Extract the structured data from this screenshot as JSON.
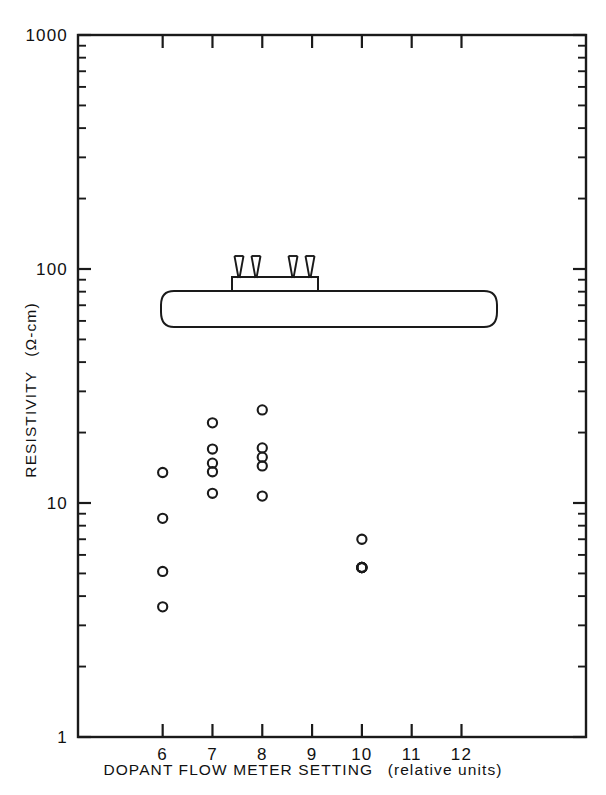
{
  "figure": {
    "background_color": "#ffffff",
    "ink_color": "#1a1a1a"
  },
  "chart_data": {
    "type": "scatter",
    "title": "",
    "xlabel": "DOPANT FLOW METER SETTING (relative units)",
    "xlabel_main": "DOPANT FLOW METER SETTING",
    "xlabel_paren": "(relative units)",
    "ylabel": "RESISTIVITY (Ω-cm)",
    "ylabel_main": "RESISTIVITY",
    "ylabel_paren": "(Ω-cm)",
    "xscale": "linear",
    "yscale": "log",
    "xlim": [
      4.3,
      14.5
    ],
    "ylim": [
      1,
      1000
    ],
    "grid": false,
    "legend": null,
    "x_tick_labels": [
      "6",
      "7",
      "8",
      "9",
      "10",
      "11",
      "12"
    ],
    "x_tick_values": [
      6,
      7,
      8,
      9,
      10,
      11,
      12
    ],
    "y_tick_labels": [
      "1000",
      "100",
      "10",
      "1"
    ],
    "y_tick_values": [
      1000,
      100,
      10,
      1
    ],
    "y_minor_ticks_per_decade": [
      2,
      3,
      4,
      5,
      6,
      7,
      8,
      9
    ],
    "marker": "open-circle",
    "points": [
      {
        "x": 6,
        "y": 13.5
      },
      {
        "x": 6,
        "y": 8.6
      },
      {
        "x": 6,
        "y": 5.1
      },
      {
        "x": 6,
        "y": 3.6
      },
      {
        "x": 7,
        "y": 22.0
      },
      {
        "x": 7,
        "y": 17.0
      },
      {
        "x": 7,
        "y": 14.8
      },
      {
        "x": 7,
        "y": 13.6
      },
      {
        "x": 7,
        "y": 11.0
      },
      {
        "x": 8,
        "y": 25.0
      },
      {
        "x": 8,
        "y": 17.2
      },
      {
        "x": 8,
        "y": 15.7
      },
      {
        "x": 8,
        "y": 14.4
      },
      {
        "x": 8,
        "y": 10.7
      },
      {
        "x": 10,
        "y": 7.0
      },
      {
        "x": 10,
        "y": 5.3
      },
      {
        "x": 10,
        "y": 5.3
      },
      {
        "x": 10,
        "y": 5.3
      },
      {
        "x": 10,
        "y": 5.3
      }
    ],
    "annotations": [
      {
        "name": "four-point-probe-diagram",
        "description": "Schematic of a four-point probe resting on a silicon wafer",
        "probe_count": 4
      }
    ]
  }
}
